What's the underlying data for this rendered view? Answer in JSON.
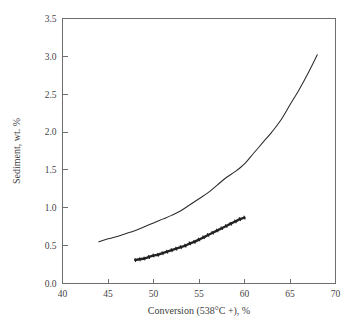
{
  "figure": {
    "background_color": "#ffffff",
    "axis_color": "#6e6e6e",
    "series_color": "#232323"
  },
  "axes": {
    "x_title": "Conversion (538°C +),  %",
    "y_title": "Sediment, wt. %",
    "x_ticks": [
      "40",
      "45",
      "50",
      "55",
      "60",
      "65",
      "70"
    ],
    "y_ticks": [
      "0.0",
      "0.5",
      "1.0",
      "1.5",
      "2.0",
      "2.5",
      "3.0",
      "3.5"
    ]
  },
  "chart_data": {
    "type": "line",
    "title": "",
    "subtitle": "",
    "xlabel": "Conversion (538°C +),  %",
    "ylabel": "Sediment, wt. %",
    "xlim": [
      40,
      70
    ],
    "ylim": [
      0.0,
      3.5
    ],
    "x_tick_values": [
      40,
      45,
      50,
      55,
      60,
      65,
      70
    ],
    "y_tick_values": [
      0.0,
      0.5,
      1.0,
      1.5,
      2.0,
      2.5,
      3.0,
      3.5
    ],
    "grid": false,
    "legend": false,
    "legend_position": "none",
    "annotations": [],
    "series": [
      {
        "name": "upper-curve",
        "style": "thin-solid-line",
        "markers": false,
        "x": [
          44.0,
          45.0,
          46.0,
          47.0,
          48.0,
          49.0,
          50.0,
          51.0,
          52.0,
          53.0,
          54.0,
          55.0,
          56.0,
          57.0,
          58.0,
          59.0,
          60.0,
          61.0,
          62.0,
          63.0,
          64.0,
          65.0,
          66.0,
          67.0,
          68.0
        ],
        "values": [
          0.55,
          0.59,
          0.62,
          0.66,
          0.7,
          0.75,
          0.8,
          0.85,
          0.9,
          0.96,
          1.04,
          1.12,
          1.2,
          1.3,
          1.4,
          1.48,
          1.58,
          1.72,
          1.86,
          2.0,
          2.16,
          2.36,
          2.56,
          2.78,
          3.02
        ]
      },
      {
        "name": "lower-curve",
        "style": "thick-solid-line-with-dense-markers",
        "markers": true,
        "x": [
          48.0,
          48.5,
          49.0,
          49.5,
          50.0,
          50.5,
          51.0,
          51.5,
          52.0,
          52.5,
          53.0,
          53.5,
          54.0,
          54.5,
          55.0,
          55.5,
          56.0,
          56.5,
          57.0,
          57.5,
          58.0,
          58.5,
          59.0,
          59.5,
          60.0
        ],
        "values": [
          0.31,
          0.32,
          0.33,
          0.35,
          0.37,
          0.38,
          0.4,
          0.42,
          0.44,
          0.46,
          0.48,
          0.5,
          0.53,
          0.55,
          0.58,
          0.61,
          0.64,
          0.67,
          0.7,
          0.73,
          0.76,
          0.79,
          0.82,
          0.85,
          0.87
        ]
      }
    ]
  }
}
